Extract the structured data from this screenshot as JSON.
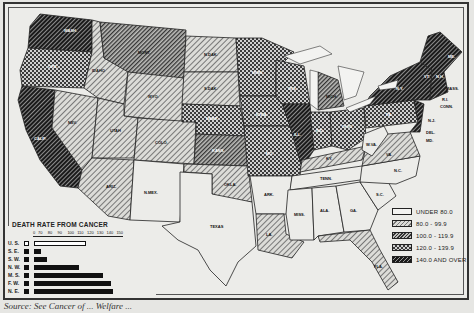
{
  "legend": {
    "items": [
      {
        "label": "UNDER 80.0",
        "pattern": "blank"
      },
      {
        "label": "80.0 -  99.9",
        "pattern": "light-hatch"
      },
      {
        "label": "100.0 - 119.9",
        "pattern": "medium-hatch"
      },
      {
        "label": "120.0 - 139.9",
        "pattern": "checker"
      },
      {
        "label": "140.0 AND OVER",
        "pattern": "dark-hatch"
      }
    ]
  },
  "bar_chart": {
    "title": "DEATH RATE FROM CANCER",
    "ticks": [
      "0",
      "70",
      "80",
      "90",
      "100",
      "110",
      "120",
      "130",
      "140",
      "150"
    ]
  },
  "source": "Source: See Cancer of ... Welfare ...",
  "states": {
    "wash": "WASH.",
    "ore": "ORE.",
    "calif": "CALIF.",
    "idaho": "IDAHO",
    "nev": "NEV.",
    "mont": "MONT.",
    "wyo": "WYO.",
    "utah": "UTAH",
    "ariz": "ARIZ.",
    "colo": "COLO.",
    "nmex": "N.MEX.",
    "ndak": "N.DAK.",
    "sdak": "S.DAK.",
    "nebr": "NEBR.",
    "kans": "KANS.",
    "okla": "OKLA.",
    "texas": "TEXAS",
    "minn": "MINN.",
    "iowa": "IOWA",
    "mo": "MO.",
    "ark": "ARK.",
    "la": "LA.",
    "wis": "WIS.",
    "ill": "ILL.",
    "mich": "MICH.",
    "ind": "IND.",
    "ohio": "OHIO",
    "ky": "KY.",
    "tenn": "TENN.",
    "miss": "MISS.",
    "ala": "ALA.",
    "ga": "GA.",
    "fla": "FLA.",
    "sc": "S.C.",
    "nc": "N.C.",
    "va": "VA.",
    "wva": "W.VA.",
    "pa": "PA.",
    "ny": "N.Y.",
    "me": "ME.",
    "vt": "VT.",
    "nh": "N.H.",
    "mass": "MASS.",
    "ri": "R.I.",
    "conn": "CONN.",
    "nj": "N.J.",
    "del": "DEL.",
    "md": "MD."
  },
  "chart_data": {
    "type": "bar",
    "title": "DEATH RATE FROM CANCER",
    "orientation": "horizontal",
    "categories": [
      "U. S.",
      "S. E.",
      "S. W.",
      "N. W.",
      "M. S.",
      "F. W.",
      "N. E."
    ],
    "values": [
      120,
      74,
      80,
      113,
      137,
      146,
      148
    ],
    "xlabel": "",
    "ylabel": "",
    "xlim": [
      0,
      150
    ],
    "axis_break": "between 0 and 70",
    "ticks": [
      0,
      70,
      80,
      90,
      100,
      110,
      120,
      130,
      140,
      150
    ],
    "highlight": {
      "U. S.": "outlined (national average)"
    },
    "map_legend": {
      "title": "Death rate from cancer (choropleth classes)",
      "classes": [
        "UNDER 80.0",
        "80.0 - 99.9",
        "100.0 - 119.9",
        "120.0 - 139.9",
        "140.0 AND OVER"
      ]
    },
    "map_classes_approx": {
      "UNDER 80.0": [
        "N.MEX.",
        "TEXAS",
        "ARK.",
        "MISS.",
        "ALA.",
        "GA.",
        "S.C.",
        "N.C.",
        "TENN.",
        "W.VA."
      ],
      "80.0 - 99.9": [
        "IDAHO",
        "WYO.",
        "UTAH",
        "ARIZ.",
        "COLO.",
        "N.DAK.",
        "S.DAK.",
        "OKLA.",
        "LA.",
        "KY.",
        "VA.",
        "FLA."
      ],
      "100.0 - 119.9": [
        "MONT.",
        "NEV.",
        "KANS.",
        "MICH."
      ],
      "120.0 - 139.9": [
        "ORE.",
        "MINN.",
        "IOWA",
        "NEBR.",
        "MO.",
        "WIS.",
        "IND.",
        "OHIO",
        "PA."
      ],
      "140.0 AND OVER": [
        "WASH.",
        "CALIF.",
        "ILL.",
        "N.Y.",
        "ME.",
        "VT.",
        "N.H.",
        "MASS.",
        "R.I.",
        "CONN.",
        "N.J.",
        "DEL.",
        "MD."
      ]
    }
  }
}
